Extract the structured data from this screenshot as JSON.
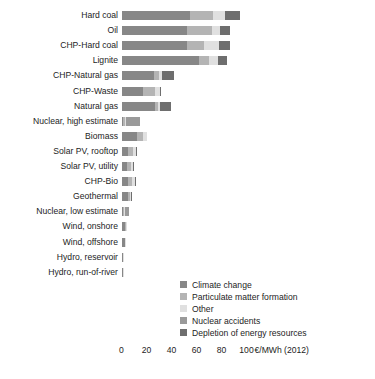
{
  "chart_data": {
    "type": "bar",
    "orientation": "horizontal",
    "stacked": true,
    "title": "",
    "subtitle": "",
    "xlabel": "€/MWh (2012)",
    "ylabel": "",
    "xlim": [
      0,
      110
    ],
    "xticks": [
      0,
      20,
      40,
      60,
      80,
      100
    ],
    "xtick_labels": [
      "0",
      "20",
      "40",
      "60",
      "80",
      "100"
    ],
    "axis_unit_label": "€/MWh (2012)",
    "grid": false,
    "legend_position": "bottom-right",
    "categories": [
      "Hard coal",
      "Oil",
      "CHP-Hard coal",
      "Lignite",
      "CHP-Natural gas",
      "CHP-Waste",
      "Natural gas",
      "Nuclear, high estimate",
      "Biomass",
      "Solar PV, rooftop",
      "Solar PV, utility",
      "CHP-Bio",
      "Geothermal",
      "Nuclear, low estimate",
      "Wind, onshore",
      "Wind, offshore",
      "Hydro, reservoir",
      "Hydro, run-of-river"
    ],
    "series": [
      {
        "name": "Climate change",
        "color": "#878787",
        "values": [
          55.0,
          52.0,
          52.0,
          62.0,
          26.0,
          17.0,
          27.0,
          1.5,
          12.0,
          5.5,
          4.5,
          5.5,
          5.0,
          1.0,
          3.0,
          2.5,
          1.0,
          1.0
        ]
      },
      {
        "name": "Particulate matter formation",
        "color": "#b4b4b4",
        "values": [
          18.0,
          20.0,
          14.0,
          8.0,
          4.0,
          10.0,
          2.0,
          1.0,
          5.0,
          3.5,
          3.0,
          3.0,
          1.5,
          0.8,
          0.8,
          0.6,
          0.3,
          0.3
        ]
      },
      {
        "name": "Other",
        "color": "#e0e0e0",
        "values": [
          10.0,
          7.0,
          12.0,
          7.0,
          2.0,
          4.0,
          1.5,
          1.0,
          3.0,
          2.5,
          2.0,
          2.0,
          1.0,
          0.6,
          0.6,
          0.5,
          0.3,
          0.3
        ]
      },
      {
        "name": "Nuclear accidents",
        "color": "#9a9a9a",
        "values": [
          0,
          0,
          0,
          0,
          0,
          0,
          0,
          11.0,
          0,
          0,
          0,
          0,
          0,
          3.5,
          0,
          0,
          0,
          0
        ]
      },
      {
        "name": "Depletion of energy resources",
        "color": "#6e6e6e",
        "values": [
          12.0,
          8.0,
          9.0,
          7.0,
          10.0,
          0.5,
          9.0,
          0,
          0,
          0.8,
          0.8,
          0.8,
          0.8,
          0,
          0,
          0,
          0,
          0
        ]
      }
    ],
    "totals": [
      95.0,
      87.0,
      87.0,
      84.0,
      42.0,
      31.5,
      39.5,
      14.5,
      20.0,
      12.3,
      10.3,
      11.3,
      8.3,
      5.9,
      4.4,
      3.6,
      1.6,
      1.6
    ]
  },
  "legend": {
    "items": [
      {
        "label": "Climate change",
        "color": "#878787"
      },
      {
        "label": "Particulate matter formation",
        "color": "#b4b4b4"
      },
      {
        "label": "Other",
        "color": "#e0e0e0"
      },
      {
        "label": "Nuclear accidents",
        "color": "#9a9a9a"
      },
      {
        "label": "Depletion of energy resources",
        "color": "#6e6e6e"
      }
    ]
  }
}
